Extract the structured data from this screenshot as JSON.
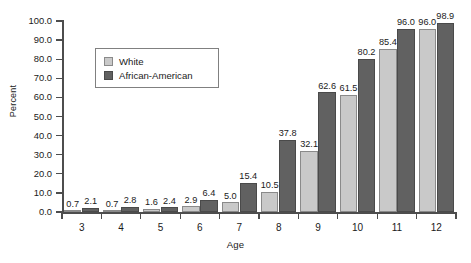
{
  "chart_data": {
    "type": "bar",
    "title": "",
    "xlabel": "Age",
    "ylabel": "Percent",
    "categories": [
      "3",
      "4",
      "5",
      "6",
      "7",
      "8",
      "9",
      "10",
      "11",
      "12"
    ],
    "series": [
      {
        "name": "White",
        "color": "#c9c9c9",
        "values": [
          0.7,
          0.7,
          1.6,
          2.9,
          5.0,
          10.5,
          32.1,
          61.5,
          85.4,
          96.0
        ]
      },
      {
        "name": "African-American",
        "color": "#616161",
        "values": [
          2.1,
          2.8,
          2.4,
          6.4,
          15.4,
          37.8,
          62.6,
          80.2,
          96.0,
          98.9
        ]
      }
    ],
    "ylim": [
      0.0,
      100.0
    ],
    "ytick_labels": [
      "0.0",
      "10.0",
      "20.0",
      "30.0",
      "40.0",
      "50.0",
      "60.0",
      "70.0",
      "80.0",
      "90.0",
      "100.0"
    ],
    "ytick_values": [
      0,
      10,
      20,
      30,
      40,
      50,
      60,
      70,
      80,
      90,
      100
    ],
    "grid": false,
    "legend_position": "upper-left-inside",
    "data_labels": true
  },
  "legend": {
    "items": [
      {
        "label": "White"
      },
      {
        "label": "African-American"
      }
    ]
  }
}
